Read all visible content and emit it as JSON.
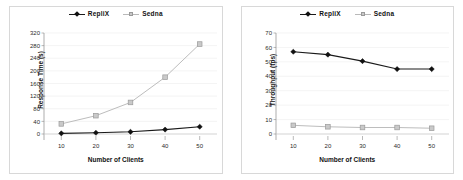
{
  "figure": {
    "background": "#ffffff",
    "panel_border": "#d8d8d8"
  },
  "series_style": {
    "replix_color": "#1a1a1a",
    "sedna_color": "#bdbdbd",
    "sedna_marker_fill": "#c9c9c9",
    "sedna_marker_stroke": "#9a9a9a"
  },
  "legend": {
    "replix_label": "RepliX",
    "sedna_label": "Sedna"
  },
  "chart_data": [
    {
      "type": "line",
      "title": "",
      "xlabel": "Number of Clients",
      "ylabel": "Response Time (s)",
      "x": [
        10,
        20,
        30,
        40,
        50
      ],
      "xticks": [
        "10",
        "20",
        "30",
        "40",
        "50"
      ],
      "yticks": [
        "0",
        "40",
        "80",
        "120",
        "160",
        "200",
        "240",
        "280",
        "320"
      ],
      "ylim": [
        0,
        320
      ],
      "xlim": [
        5,
        55
      ],
      "grid": true,
      "legend_position": "top-center",
      "series": [
        {
          "name": "RepliX",
          "values": [
            2,
            4,
            7,
            14,
            23
          ]
        },
        {
          "name": "Sedna",
          "values": [
            32,
            58,
            100,
            180,
            285
          ]
        }
      ]
    },
    {
      "type": "line",
      "title": "",
      "xlabel": "Number of Clients",
      "ylabel": "Throughput (tps)",
      "x": [
        10,
        20,
        30,
        40,
        50
      ],
      "xticks": [
        "10",
        "20",
        "30",
        "40",
        "50"
      ],
      "yticks": [
        "0",
        "10",
        "20",
        "30",
        "40",
        "50",
        "60",
        "70"
      ],
      "ylim": [
        0,
        70
      ],
      "xlim": [
        5,
        55
      ],
      "grid": true,
      "legend_position": "top-center",
      "series": [
        {
          "name": "RepliX",
          "values": [
            57,
            55,
            50.5,
            45,
            45
          ]
        },
        {
          "name": "Sedna",
          "values": [
            6,
            5,
            4.5,
            4.5,
            4
          ]
        }
      ]
    }
  ]
}
